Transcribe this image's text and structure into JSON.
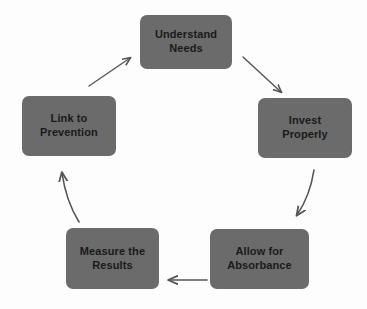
{
  "diagram": {
    "type": "cycle-flow",
    "background_color": "#fdfdfd",
    "node_fill_color": "#6b6b6b",
    "node_text_color": "#1a1a1a",
    "arrow_color": "#555555",
    "nodes": [
      {
        "id": "understand-needs",
        "label": "Understand\nNeeds",
        "x": 140,
        "y": 15,
        "width": 92,
        "height": 54
      },
      {
        "id": "invest-properly",
        "label": "Invest\nProperly",
        "x": 258,
        "y": 98,
        "width": 94,
        "height": 60
      },
      {
        "id": "allow-for-absorbance",
        "label": "Allow for\nAbsorbance",
        "x": 210,
        "y": 229,
        "width": 99,
        "height": 60
      },
      {
        "id": "measure-the-results",
        "label": "Measure the\nResults",
        "x": 66,
        "y": 228,
        "width": 93,
        "height": 61
      },
      {
        "id": "link-to-prevention",
        "label": "Link to\nPrevention",
        "x": 22,
        "y": 96,
        "width": 94,
        "height": 60
      }
    ],
    "connectors": [
      {
        "id": "arrow-understand-to-invest",
        "from": "understand-needs",
        "to": "invest-properly",
        "direction": "down-right"
      },
      {
        "id": "arrow-invest-to-absorbance",
        "from": "invest-properly",
        "to": "allow-for-absorbance",
        "direction": "down-left-curved"
      },
      {
        "id": "arrow-absorbance-to-measure",
        "from": "allow-for-absorbance",
        "to": "measure-the-results",
        "direction": "left"
      },
      {
        "id": "arrow-measure-to-link",
        "from": "measure-the-results",
        "to": "link-to-prevention",
        "direction": "up-curved"
      },
      {
        "id": "arrow-link-to-understand",
        "from": "link-to-prevention",
        "to": "understand-needs",
        "direction": "up-right"
      }
    ]
  }
}
